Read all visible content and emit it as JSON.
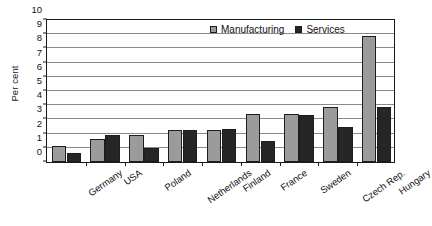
{
  "chart_data": {
    "type": "bar",
    "title": "",
    "subtitle": "",
    "xlabel": "",
    "ylabel": "Per cent",
    "ylim": [
      0,
      10
    ],
    "ytick_step": 1,
    "yticks": [
      "10",
      "9",
      "8",
      "7",
      "6",
      "5",
      "4",
      "3",
      "2",
      "1",
      "0"
    ],
    "grid": true,
    "legend_position": "top-right inside plot",
    "categories": [
      "Germany",
      "USA",
      "Poland",
      "Netherlands",
      "Finland",
      "France",
      "Sweden",
      "Czech Rep.",
      "Hungary"
    ],
    "series": [
      {
        "name": "Manufacturing",
        "color": "#9b9b9b",
        "values": [
          1.1,
          1.6,
          1.9,
          2.2,
          2.25,
          3.35,
          3.35,
          3.8,
          8.75
        ]
      },
      {
        "name": "Services",
        "color": "#262626",
        "values": [
          0.65,
          1.9,
          1.0,
          2.2,
          2.3,
          1.45,
          3.25,
          2.45,
          3.8
        ]
      }
    ]
  },
  "legend": {
    "entries": [
      {
        "label": "Manufacturing",
        "swatch": "manufacturing"
      },
      {
        "label": "Services",
        "swatch": "services"
      }
    ]
  }
}
